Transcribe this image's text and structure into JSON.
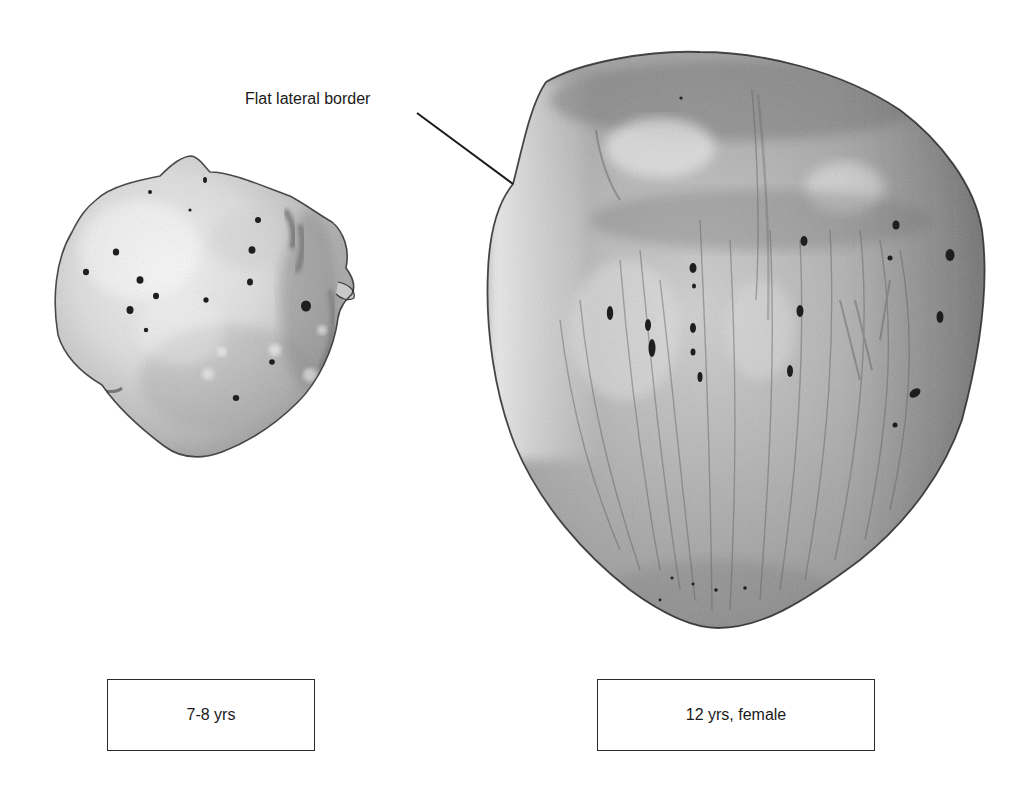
{
  "figure": {
    "annotation": {
      "label": "Flat lateral border",
      "leader_line": {
        "x1": 417,
        "y1": 113,
        "x2": 513,
        "y2": 184
      }
    },
    "specimens": [
      {
        "id": "left",
        "caption": "7-8 yrs",
        "description": "small rounded patella with pitted surface"
      },
      {
        "id": "right",
        "caption": "12 yrs, female",
        "description": "larger triangular patella with striated surface and flat lateral border"
      }
    ],
    "colors": {
      "outline": "#2a2a2a",
      "bone_light": "#e8e8e8",
      "bone_mid": "#a9a9a9",
      "bone_dark": "#6e6e6e",
      "pit": "#1e1e1e",
      "background": "#ffffff"
    }
  }
}
